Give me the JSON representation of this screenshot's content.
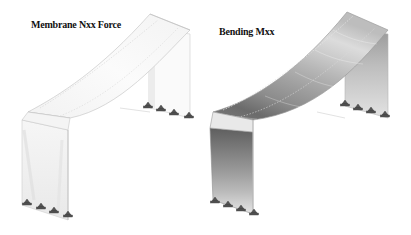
{
  "figure": {
    "panels": [
      {
        "title": "Membrane Nxx Force",
        "shading": "light",
        "colors": [
          "#f7f7f7",
          "#f0f0f0",
          "#e8e8e8",
          "#e2e2e2"
        ]
      },
      {
        "title": "Bending Mxx",
        "shading": "graded",
        "colors": [
          "#6e6e6e",
          "#7f7f7f",
          "#919191",
          "#a4a4a4",
          "#b8b8b8",
          "#cbcbcb",
          "#dddddd",
          "#eeeeee"
        ]
      }
    ],
    "supports_per_column": 4,
    "edge_color": "#bdbdbd",
    "support_color": "#555555"
  }
}
